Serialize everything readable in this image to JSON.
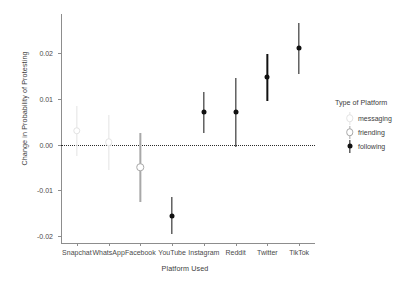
{
  "chart_data": {
    "type": "scatter",
    "title": "",
    "xlabel": "Platform Used",
    "ylabel": "Change in Probability of Protesting",
    "categories": [
      "Snapchat",
      "WhatsApp",
      "Facebook",
      "YouTube",
      "Instagram",
      "Reddit",
      "Twitter",
      "TikTok"
    ],
    "values": [
      0.003,
      0.0005,
      -0.005,
      -0.0155,
      0.007,
      0.007,
      0.0147,
      0.021
    ],
    "ci_low": [
      -0.0025,
      -0.0055,
      -0.0125,
      -0.0195,
      0.0025,
      -0.0005,
      0.0095,
      0.0155
    ],
    "ci_high": [
      0.0085,
      0.0065,
      0.0025,
      -0.0115,
      0.0115,
      0.0145,
      0.0198,
      0.0265
    ],
    "groups": [
      "messaging",
      "messaging",
      "friending",
      "following",
      "following",
      "following",
      "following",
      "following"
    ],
    "ylim": [
      -0.0215,
      0.0285
    ],
    "yticks": [
      -0.02,
      -0.01,
      0.0,
      0.01,
      0.02
    ],
    "ytick_labels": [
      "-0.02",
      "-0.01",
      "0.00",
      "0.01",
      "0.02"
    ],
    "reference_line": 0.0,
    "grid": false,
    "legend_position": "right"
  },
  "legend": {
    "title": "Type of Platform",
    "entries": [
      {
        "label": "messaging",
        "color": "#e3e3e3"
      },
      {
        "label": "friending",
        "color": "#a8a8a8"
      },
      {
        "label": "following",
        "color": "#111111"
      }
    ]
  },
  "colors": {
    "messaging": "#e3e3e3",
    "friending": "#a8a8a8",
    "following": "#111111",
    "axis": "#8d8d8d",
    "text": "#3d3d3d",
    "reference": "#2b2b2b"
  }
}
